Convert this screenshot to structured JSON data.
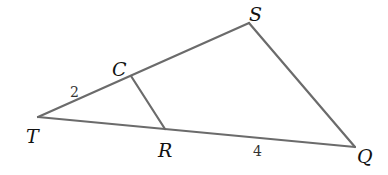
{
  "diagram": {
    "type": "geometry-triangle",
    "colors": {
      "background": "#ffffff",
      "edge": "#6b6b6b",
      "text": "#111111"
    },
    "vertices": {
      "T": {
        "label": "T",
        "x": 38,
        "y": 117
      },
      "S": {
        "label": "S",
        "x": 249,
        "y": 23
      },
      "Q": {
        "label": "Q",
        "x": 355,
        "y": 147
      },
      "C": {
        "label": "C",
        "x": 131,
        "y": 76
      },
      "R": {
        "label": "R",
        "x": 165,
        "y": 129
      }
    },
    "segments": [
      {
        "from": "T",
        "to": "S"
      },
      {
        "from": "S",
        "to": "Q"
      },
      {
        "from": "T",
        "to": "Q"
      },
      {
        "from": "C",
        "to": "R"
      }
    ],
    "measurements": [
      {
        "segment": "TC",
        "value": "2"
      },
      {
        "segment": "RQ",
        "value": "4"
      }
    ]
  }
}
